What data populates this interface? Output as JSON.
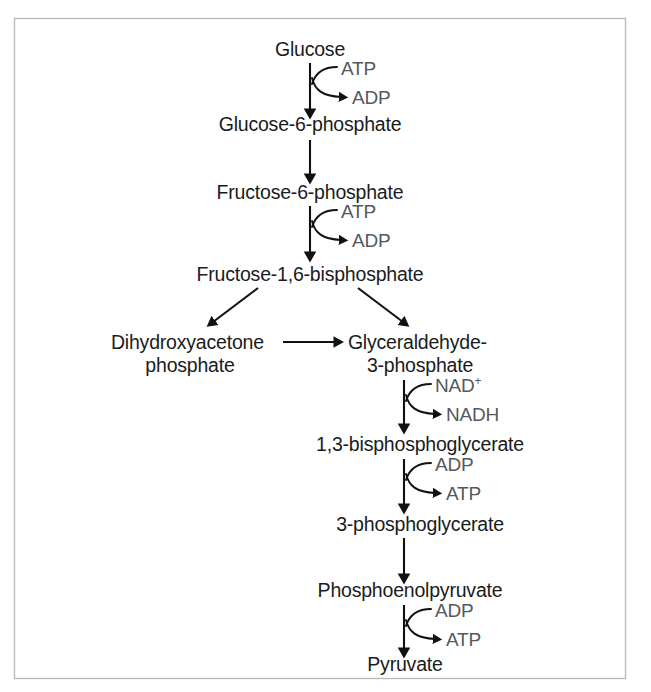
{
  "figure": {
    "width": 651,
    "height": 692,
    "background_color": "#ffffff",
    "border_color": "#b9babc",
    "text_color": "#1b1b1b",
    "cofactor_text_color": "#55585c",
    "arrow_color": "#111111"
  },
  "metabolites": [
    {
      "id": "glucose",
      "label": "Glucose",
      "x": 310,
      "y": 55,
      "lines": [
        "Glucose"
      ]
    },
    {
      "id": "g6p",
      "label": "Glucose-6-phosphate",
      "x": 310,
      "y": 130,
      "lines": [
        "Glucose-6-phosphate"
      ]
    },
    {
      "id": "f6p",
      "label": "Fructose-6-phosphate",
      "x": 310,
      "y": 195,
      "lines": [
        "Fructose-6-phosphate"
      ]
    },
    {
      "id": "f16bp",
      "label": "Fructose-1,6-bisphosphate",
      "x": 310,
      "y": 278,
      "lines": [
        "Fructose-1,6-bisphosphate"
      ]
    },
    {
      "id": "dhap",
      "label": "Dihydroxyacetone phosphate",
      "x": 190,
      "y": 348,
      "lines": [
        "Dihydroxyacetone",
        "phosphate"
      ]
    },
    {
      "id": "g3p",
      "label": "Glyceraldehyde-3-phosphate",
      "x": 420,
      "y": 348,
      "lines": [
        "Glyceraldehyde-",
        "3-phosphate"
      ]
    },
    {
      "id": "bpg13",
      "label": "1,3-bisphosphoglycerate",
      "x": 420,
      "y": 448,
      "lines": [
        "1,3-bisphosphoglycerate"
      ]
    },
    {
      "id": "pg3",
      "label": "3-phosphoglycerate",
      "x": 420,
      "y": 528,
      "lines": [
        "3-phosphoglycerate"
      ]
    },
    {
      "id": "pep",
      "label": "Phosphoenolpyruvate",
      "x": 410,
      "y": 594,
      "lines": [
        "Phosphoenolpyruvate"
      ]
    },
    {
      "id": "pyruvate",
      "label": "Pyruvate",
      "x": 405,
      "y": 668,
      "lines": [
        "Pyruvate"
      ]
    }
  ],
  "reaction_steps": [
    {
      "id": "step-hexokinase",
      "from": "glucose",
      "to": "g6p",
      "axis_x": 310,
      "y_start": 63,
      "y_end": 113,
      "substrate": {
        "name": "ATP",
        "superscript": "",
        "x": 341,
        "y": 75
      },
      "product": {
        "name": "ADP",
        "superscript": "",
        "x": 349,
        "y": 100
      }
    },
    {
      "id": "step-pfk",
      "from": "f6p",
      "to": "f16bp",
      "axis_x": 310,
      "y_start": 205,
      "y_end": 256,
      "substrate": {
        "name": "ATP",
        "superscript": "",
        "x": 341,
        "y": 218
      },
      "product": {
        "name": "ADP",
        "superscript": "",
        "x": 349,
        "y": 243
      }
    },
    {
      "id": "step-gapdh",
      "from": "g3p",
      "to": "bpg13",
      "axis_x": 404,
      "y_start": 378,
      "y_end": 428,
      "substrate": {
        "name": "NAD",
        "superscript": "+",
        "x": 435,
        "y": 390
      },
      "product": {
        "name": "NADH",
        "superscript": "",
        "x": 443,
        "y": 415
      }
    },
    {
      "id": "step-pgk",
      "from": "bpg13",
      "to": "pg3",
      "axis_x": 404,
      "y_start": 458,
      "y_end": 508,
      "substrate": {
        "name": "ADP",
        "superscript": "",
        "x": 435,
        "y": 470
      },
      "product": {
        "name": "ATP",
        "superscript": "",
        "x": 443,
        "y": 495
      }
    },
    {
      "id": "step-pyruvate-kinase",
      "from": "pep",
      "to": "pyruvate",
      "axis_x": 404,
      "y_start": 604,
      "y_end": 652,
      "substrate": {
        "name": "ADP",
        "superscript": "",
        "x": 435,
        "y": 616
      },
      "product": {
        "name": "ATP",
        "superscript": "",
        "x": 443,
        "y": 641
      }
    }
  ],
  "plain_arrows": [
    {
      "id": "arrow-g6p-to-f6p",
      "from": "g6p",
      "to": "f6p",
      "x1": 310,
      "y1": 140,
      "x2": 310,
      "y2": 178
    },
    {
      "id": "arrow-f16bp-to-dhap",
      "from": "f16bp",
      "to": "dhap",
      "x1": 258,
      "y1": 288,
      "x2": 212,
      "y2": 324
    },
    {
      "id": "arrow-f16bp-to-g3p",
      "from": "f16bp",
      "to": "g3p",
      "x1": 358,
      "y1": 288,
      "x2": 404,
      "y2": 324
    },
    {
      "id": "arrow-dhap-to-g3p",
      "from": "dhap",
      "to": "g3p",
      "x1": 283,
      "y1": 342,
      "x2": 338,
      "y2": 342
    },
    {
      "id": "arrow-pg3-to-pep",
      "from": "pg3",
      "to": "pep",
      "x1": 404,
      "y1": 538,
      "x2": 404,
      "y2": 578
    }
  ],
  "legend_note": ""
}
